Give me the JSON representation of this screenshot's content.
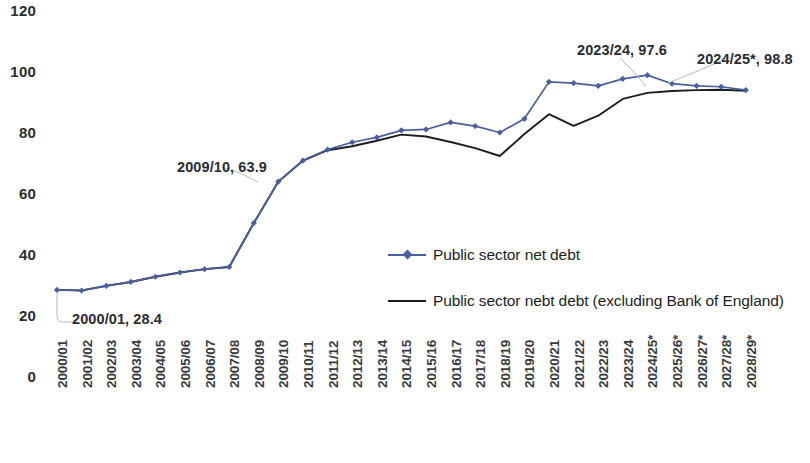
{
  "chart_data": {
    "type": "line",
    "title": "",
    "xlabel": "",
    "ylabel": "",
    "ylim": [
      0,
      120
    ],
    "yticks": [
      0,
      20,
      40,
      60,
      80,
      100,
      120
    ],
    "grid": false,
    "legend_position": "center-right",
    "categories": [
      "2000/01",
      "2001/02",
      "2002/03",
      "2003/04",
      "2004/05",
      "2005/06",
      "2006/07",
      "2007/08",
      "2008/09",
      "2009/10",
      "2010/11",
      "2011/12",
      "2012/13",
      "2013/14",
      "2014/15",
      "2015/16",
      "2016/17",
      "2017/18",
      "2018/19",
      "2019/20",
      "2020/21",
      "2021/22",
      "2022/23",
      "2023/24",
      "2024/25*",
      "2025/26*",
      "2026/27*",
      "2027/28*",
      "2028/29*"
    ],
    "series": [
      {
        "name": "Public sector net debt",
        "color": "#4a5f9e",
        "marker": "diamond",
        "values": [
          28.4,
          28.2,
          29.7,
          31.0,
          32.7,
          34.1,
          35.2,
          35.9,
          50.3,
          63.9,
          70.8,
          74.4,
          76.8,
          78.4,
          80.7,
          81.0,
          83.3,
          82.1,
          80.0,
          84.5,
          96.6,
          96.2,
          95.3,
          97.6,
          98.8,
          96.0,
          95.3,
          95.0,
          93.9
        ]
      },
      {
        "name": "Public sector nebt debt (excluding Bank of England)",
        "color": "#1c1c24",
        "marker": "none",
        "values": [
          28.4,
          28.2,
          29.7,
          31.0,
          32.7,
          34.1,
          35.2,
          35.9,
          50.3,
          63.9,
          70.8,
          74.2,
          75.5,
          77.3,
          79.3,
          78.7,
          76.9,
          74.9,
          72.3,
          79.5,
          86.0,
          82.2,
          85.5,
          91.0,
          93.0,
          93.6,
          93.9,
          94.0,
          93.7
        ]
      }
    ],
    "annotations": [
      {
        "label": "2000/01, 28.4",
        "category": "2000/01",
        "value": 28.4
      },
      {
        "label": "2009/10, 63.9",
        "category": "2009/10",
        "value": 63.9
      },
      {
        "label": "2023/24, 97.6",
        "category": "2023/24",
        "value": 97.6
      },
      {
        "label": "2024/25*, 98.8",
        "category": "2024/25*",
        "value": 98.8
      }
    ]
  },
  "axes": {
    "y_labels": [
      "120",
      "100",
      "80",
      "60",
      "40",
      "20",
      "0"
    ],
    "x_labels": [
      "2000/01",
      "2001/02",
      "2002/03",
      "2003/04",
      "2004/05",
      "2005/06",
      "2006/07",
      "2007/08",
      "2008/09",
      "2009/10",
      "2010/11",
      "2011/12",
      "2012/13",
      "2013/14",
      "2014/15",
      "2015/16",
      "2016/17",
      "2017/18",
      "2018/19",
      "2019/20",
      "2020/21",
      "2021/22",
      "2022/23",
      "2023/24",
      "2024/25*",
      "2025/26*",
      "2026/27*",
      "2027/28*",
      "2028/29*"
    ]
  },
  "legend": {
    "items": [
      {
        "label": "Public sector net debt",
        "color": "#4a5f9e",
        "marker": "diamond"
      },
      {
        "label": "Public sector nebt debt (excluding Bank of England)",
        "color": "#1c1c24",
        "marker": "none"
      }
    ]
  },
  "annotations": {
    "a0": "2000/01, 28.4",
    "a1": "2009/10, 63.9",
    "a2": "2023/24, 97.6",
    "a3": "2024/25*, 98.8"
  }
}
